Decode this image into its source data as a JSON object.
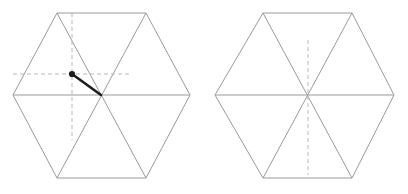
{
  "figure": {
    "background_color": "#ffffff",
    "width": 408,
    "height": 194,
    "line_color": "#9a9a9a",
    "dashed_color": "#b9b9b9",
    "arrow_color": "#1c1c1c"
  },
  "chart_data": {
    "type": "diagram",
    "shapes": [
      {
        "name": "left-hexagon",
        "center": [
          101,
          95
        ],
        "vertices": [
          [
            57,
            13
          ],
          [
            146,
            13
          ],
          [
            190,
            95
          ],
          [
            146,
            178
          ],
          [
            57,
            178
          ],
          [
            13,
            95
          ]
        ],
        "diagonals": [
          [
            [
              57,
              13
            ],
            [
              146,
              178
            ]
          ],
          [
            [
              146,
              13
            ],
            [
              57,
              178
            ]
          ],
          [
            [
              13,
              95
            ],
            [
              190,
              95
            ]
          ]
        ],
        "guides": [
          {
            "name": "vertical-dashed-guide",
            "orientation": "vertical",
            "from": [
              72,
              13
            ],
            "to": [
              72,
              140
            ]
          },
          {
            "name": "horizontal-dashed-guide",
            "orientation": "horizontal",
            "from": [
              13,
              74
            ],
            "to": [
              131,
              74
            ]
          }
        ],
        "vector": {
          "name": "position-vector",
          "from": [
            101,
            95
          ],
          "to": [
            72,
            74
          ],
          "head": "dot",
          "dot_radius": 3.1
        }
      },
      {
        "name": "right-hexagon",
        "center": [
          308,
          95
        ],
        "vertices": [
          [
            263,
            13
          ],
          [
            352,
            13
          ],
          [
            394,
            95
          ],
          [
            352,
            178
          ],
          [
            263,
            178
          ],
          [
            215,
            95
          ]
        ],
        "diagonals": [
          [
            [
              263,
              13
            ],
            [
              352,
              178
            ]
          ],
          [
            [
              352,
              13
            ],
            [
              263,
              178
            ]
          ],
          [
            [
              215,
              95
            ],
            [
              394,
              95
            ]
          ]
        ],
        "guides": [
          {
            "name": "vertical-dashed-guide",
            "orientation": "vertical",
            "from": [
              308,
              40
            ],
            "to": [
              308,
              175
            ]
          }
        ],
        "vector": null
      }
    ]
  }
}
